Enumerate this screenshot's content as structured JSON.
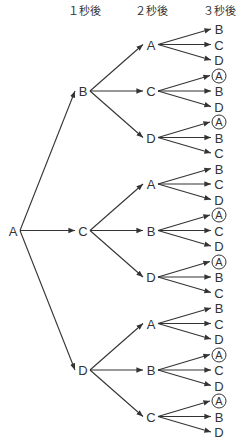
{
  "headers": {
    "level1": "１秒後",
    "level2": "２秒後",
    "level3": "３秒後"
  },
  "colors": {
    "line": "#333333",
    "text": "#333333",
    "background": "#ffffff"
  },
  "tree": {
    "label": "A",
    "children": [
      {
        "label": "B",
        "children": [
          {
            "label": "A",
            "children": [
              {
                "label": "B"
              },
              {
                "label": "C"
              },
              {
                "label": "D"
              }
            ]
          },
          {
            "label": "C",
            "children": [
              {
                "label": "A",
                "circled": true
              },
              {
                "label": "B"
              },
              {
                "label": "D"
              }
            ]
          },
          {
            "label": "D",
            "children": [
              {
                "label": "A",
                "circled": true
              },
              {
                "label": "B"
              },
              {
                "label": "C"
              }
            ]
          }
        ]
      },
      {
        "label": "C",
        "children": [
          {
            "label": "A",
            "children": [
              {
                "label": "B"
              },
              {
                "label": "C"
              },
              {
                "label": "D"
              }
            ]
          },
          {
            "label": "B",
            "children": [
              {
                "label": "A",
                "circled": true
              },
              {
                "label": "C"
              },
              {
                "label": "D"
              }
            ]
          },
          {
            "label": "D",
            "children": [
              {
                "label": "A",
                "circled": true
              },
              {
                "label": "B"
              },
              {
                "label": "C"
              }
            ]
          }
        ]
      },
      {
        "label": "D",
        "children": [
          {
            "label": "A",
            "children": [
              {
                "label": "B"
              },
              {
                "label": "C"
              },
              {
                "label": "D"
              }
            ]
          },
          {
            "label": "B",
            "children": [
              {
                "label": "A",
                "circled": true
              },
              {
                "label": "C"
              },
              {
                "label": "D"
              }
            ]
          },
          {
            "label": "C",
            "children": [
              {
                "label": "A",
                "circled": true
              },
              {
                "label": "B"
              },
              {
                "label": "D"
              }
            ]
          }
        ]
      }
    ]
  }
}
